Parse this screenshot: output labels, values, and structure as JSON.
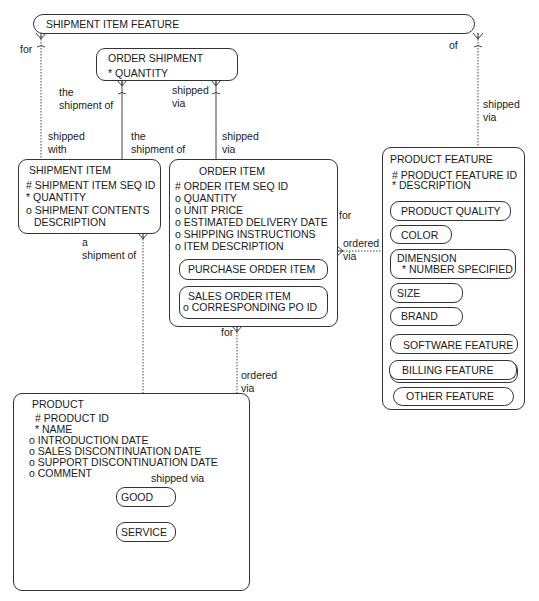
{
  "entities": {
    "shipment_item_feature": {
      "title": "SHIPMENT ITEM FEATURE"
    },
    "order_shipment": {
      "title": "ORDER SHIPMENT",
      "attrs": [
        "* QUANTITY"
      ]
    },
    "shipment_item": {
      "title": "SHIPMENT ITEM",
      "attrs": [
        "#  SHIPMENT ITEM SEQ ID",
        "*  QUANTITY",
        "o SHIPMENT CONTENTS",
        "DESCRIPTION"
      ]
    },
    "order_item": {
      "title": "ORDER ITEM",
      "attrs": [
        "#  ORDER ITEM SEQ ID",
        "o  QUANTITY",
        "o  UNIT PRICE",
        "o  ESTIMATED DELIVERY DATE",
        "o  SHIPPING INSTRUCTIONS",
        "o ITEM DESCRIPTION"
      ],
      "subtypes": [
        {
          "title": "PURCHASE ORDER ITEM"
        },
        {
          "title": "SALES ORDER ITEM",
          "attrs": [
            "o  CORRESPONDING PO ID"
          ]
        }
      ]
    },
    "product_feature": {
      "title": "PRODUCT FEATURE",
      "attrs": [
        "#  PRODUCT FEATURE ID",
        "*  DESCRIPTION"
      ],
      "subtypes": [
        {
          "title": "PRODUCT QUALITY"
        },
        {
          "title": "COLOR"
        },
        {
          "title": "DIMENSION",
          "attrs": [
            "* NUMBER SPECIFIED"
          ]
        },
        {
          "title": "SIZE"
        },
        {
          "title": "BRAND"
        },
        {
          "title": "SOFTWARE FEATURE"
        },
        {
          "title": "HARDWARE FEATURE"
        },
        {
          "title": "BILLING FEATURE"
        },
        {
          "title": "OTHER FEATURE"
        }
      ]
    },
    "product": {
      "title": "PRODUCT",
      "attrs": [
        "#  PRODUCT ID",
        "*  NAME",
        "o  INTRODUCTION DATE",
        "o  SALES DISCONTINUATION DATE",
        "o  SUPPORT DISCONTINUATION DATE",
        "o  COMMENT"
      ],
      "subtypes": [
        {
          "title": "GOOD"
        },
        {
          "title": "SERVICE"
        }
      ]
    }
  },
  "relationships": {
    "sif_for": "for",
    "sif_of": "of",
    "os_the_shipment_of": [
      "the",
      "shipment of"
    ],
    "os_shipped_via": [
      "shipped",
      "via"
    ],
    "si_shipped_with": [
      "shipped",
      "with"
    ],
    "si_the_shipment_of": [
      "the",
      "shipment of"
    ],
    "oi_shipped_via": [
      "shipped",
      "via"
    ],
    "pf_shipped_via": [
      "shipped",
      "via"
    ],
    "oi_for_pf": "for",
    "pf_ordered_via": [
      "ordered",
      "via"
    ],
    "si_a_shipment_of": [
      "a",
      "shipment of"
    ],
    "oi_for_product": "for",
    "product_ordered_via": [
      "ordered",
      "via"
    ],
    "good_shipped_via": "shipped via"
  }
}
